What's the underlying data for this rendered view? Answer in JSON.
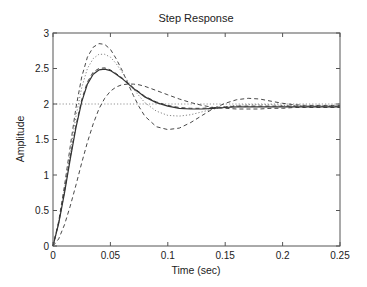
{
  "chart_data": {
    "type": "line",
    "title": "Step Response",
    "xlabel": "Time (sec)",
    "ylabel": "Amplitude",
    "xlim": [
      0,
      0.25
    ],
    "ylim": [
      0,
      3
    ],
    "xticks": [
      0,
      0.05,
      0.1,
      0.15,
      0.2,
      0.25
    ],
    "xtick_labels": [
      "0",
      "0.05",
      "0.1",
      "0.15",
      "0.2",
      "0.25"
    ],
    "yticks": [
      0,
      0.5,
      1,
      1.5,
      2,
      2.5,
      3
    ],
    "ytick_labels": [
      "0",
      "0.5",
      "1",
      "1.5",
      "2",
      "2.5",
      "3"
    ],
    "grid": false,
    "legend": null,
    "reference_line": {
      "y": 2,
      "style": "dotted",
      "label": "steady-state"
    },
    "series": [
      {
        "name": "response-high-overshoot",
        "style": "dashed",
        "x": [
          0,
          0.005,
          0.01,
          0.015,
          0.02,
          0.025,
          0.03,
          0.035,
          0.04,
          0.045,
          0.05,
          0.055,
          0.06,
          0.065,
          0.07,
          0.075,
          0.08,
          0.09,
          0.1,
          0.11,
          0.12,
          0.13,
          0.14,
          0.15,
          0.16,
          0.17,
          0.18,
          0.19,
          0.2,
          0.21,
          0.22,
          0.23,
          0.24,
          0.25
        ],
        "values": [
          0,
          0.35,
          0.85,
          1.4,
          1.95,
          2.38,
          2.66,
          2.8,
          2.85,
          2.84,
          2.77,
          2.64,
          2.48,
          2.3,
          2.12,
          1.96,
          1.83,
          1.68,
          1.64,
          1.66,
          1.74,
          1.84,
          1.94,
          2.01,
          2.06,
          2.08,
          2.07,
          2.04,
          2.01,
          1.99,
          1.98,
          1.98,
          1.98,
          1.98
        ]
      },
      {
        "name": "response-medium-overshoot",
        "style": "dotted",
        "x": [
          0,
          0.005,
          0.01,
          0.015,
          0.02,
          0.025,
          0.03,
          0.035,
          0.04,
          0.045,
          0.05,
          0.055,
          0.06,
          0.065,
          0.07,
          0.08,
          0.09,
          0.1,
          0.11,
          0.12,
          0.13,
          0.14,
          0.15,
          0.16,
          0.17,
          0.18,
          0.19,
          0.2,
          0.21,
          0.22,
          0.23,
          0.24,
          0.25
        ],
        "values": [
          0,
          0.33,
          0.8,
          1.32,
          1.83,
          2.23,
          2.5,
          2.64,
          2.7,
          2.7,
          2.66,
          2.57,
          2.45,
          2.33,
          2.21,
          2.02,
          1.9,
          1.84,
          1.83,
          1.85,
          1.89,
          1.93,
          1.96,
          1.98,
          1.99,
          1.99,
          1.99,
          1.98,
          1.98,
          1.97,
          1.97,
          1.97,
          1.97
        ]
      },
      {
        "name": "response-nominal",
        "style": "solid",
        "x": [
          0,
          0.005,
          0.01,
          0.015,
          0.02,
          0.025,
          0.03,
          0.035,
          0.04,
          0.045,
          0.05,
          0.055,
          0.06,
          0.065,
          0.07,
          0.075,
          0.08,
          0.09,
          0.1,
          0.11,
          0.12,
          0.13,
          0.14,
          0.15,
          0.16,
          0.17,
          0.18,
          0.19,
          0.2,
          0.21,
          0.22,
          0.23,
          0.24,
          0.25
        ],
        "values": [
          0,
          0.32,
          0.75,
          1.22,
          1.67,
          2.03,
          2.28,
          2.42,
          2.48,
          2.49,
          2.47,
          2.42,
          2.36,
          2.29,
          2.22,
          2.16,
          2.1,
          2.02,
          1.97,
          1.94,
          1.93,
          1.93,
          1.94,
          1.95,
          1.96,
          1.96,
          1.96,
          1.96,
          1.96,
          1.96,
          1.96,
          1.96,
          1.96,
          1.96
        ]
      },
      {
        "name": "response-nominal-alt",
        "style": "dashed",
        "x": [
          0,
          0.005,
          0.01,
          0.015,
          0.02,
          0.025,
          0.03,
          0.035,
          0.04,
          0.045,
          0.05,
          0.055,
          0.06,
          0.065,
          0.07,
          0.075,
          0.08,
          0.09,
          0.1,
          0.11,
          0.12,
          0.13,
          0.14,
          0.15,
          0.16,
          0.17,
          0.18,
          0.19,
          0.2,
          0.21,
          0.22,
          0.23,
          0.24,
          0.25
        ],
        "values": [
          0,
          0.33,
          0.77,
          1.25,
          1.7,
          2.06,
          2.31,
          2.45,
          2.5,
          2.51,
          2.48,
          2.43,
          2.37,
          2.3,
          2.23,
          2.17,
          2.11,
          2.03,
          1.98,
          1.95,
          1.94,
          1.94,
          1.95,
          1.96,
          1.97,
          1.97,
          1.97,
          1.97,
          1.97,
          1.97,
          1.97,
          1.97,
          1.97,
          1.97
        ]
      },
      {
        "name": "response-slow",
        "style": "dashed",
        "x": [
          0,
          0.005,
          0.01,
          0.015,
          0.02,
          0.025,
          0.03,
          0.035,
          0.04,
          0.045,
          0.05,
          0.055,
          0.06,
          0.065,
          0.07,
          0.075,
          0.08,
          0.085,
          0.09,
          0.1,
          0.11,
          0.12,
          0.13,
          0.14,
          0.15,
          0.16,
          0.17,
          0.18,
          0.19,
          0.2,
          0.21,
          0.22,
          0.23,
          0.24,
          0.25
        ],
        "values": [
          0,
          0.1,
          0.3,
          0.56,
          0.86,
          1.17,
          1.46,
          1.72,
          1.93,
          2.08,
          2.18,
          2.24,
          2.27,
          2.28,
          2.28,
          2.27,
          2.25,
          2.22,
          2.19,
          2.13,
          2.07,
          2.02,
          1.98,
          1.95,
          1.94,
          1.93,
          1.93,
          1.93,
          1.94,
          1.94,
          1.95,
          1.95,
          1.95,
          1.95,
          1.95
        ]
      }
    ]
  },
  "layout": {
    "plot": {
      "left": 53,
      "top": 33,
      "right": 340,
      "bottom": 246
    },
    "colors": {
      "axis": "#555555",
      "line": "#333333",
      "reference": "#888888",
      "background": "#ffffff"
    }
  }
}
